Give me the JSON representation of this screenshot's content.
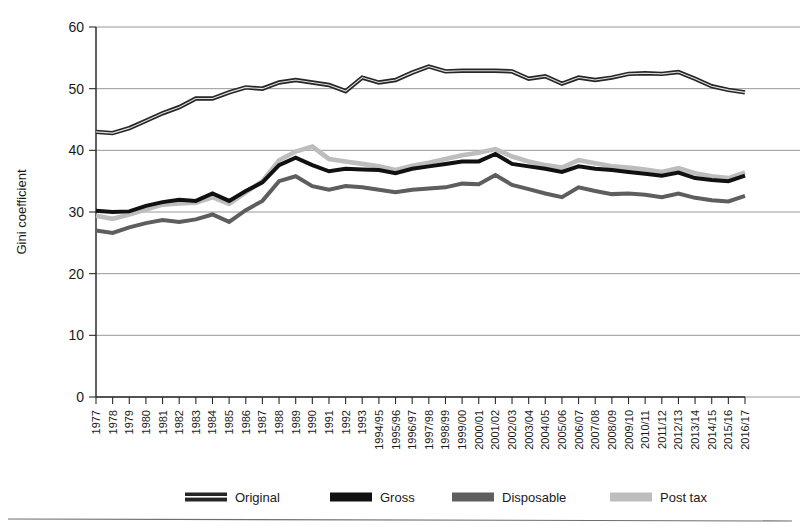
{
  "chart_data": {
    "type": "line",
    "title": "",
    "xlabel": "",
    "ylabel": "Gini coefficient",
    "ylim": [
      0,
      60
    ],
    "ytick_labels": [
      "0",
      "10",
      "20",
      "30",
      "40",
      "50",
      "60"
    ],
    "ytick_values": [
      0,
      10,
      20,
      30,
      40,
      50,
      60
    ],
    "grid": true,
    "legend_position": "bottom",
    "categories": [
      "1977",
      "1978",
      "1979",
      "1980",
      "1981",
      "1982",
      "1983",
      "1984",
      "1985",
      "1986",
      "1987",
      "1988",
      "1989",
      "1990",
      "1991",
      "1992",
      "1993",
      "1994/95",
      "1995/96",
      "1996/97",
      "1997/98",
      "1998/99",
      "1999/00",
      "2000/01",
      "2001/02",
      "2002/03",
      "2003/04",
      "2004/05",
      "2005/06",
      "2006/07",
      "2007/08",
      "2008/09",
      "2009/10",
      "2010/11",
      "2011/12",
      "2012/13",
      "2013/14",
      "2014/15",
      "2015/16",
      "2016/17"
    ],
    "series": [
      {
        "name": "Original",
        "color": "#262626",
        "style": "dark-outline",
        "values": [
          43.0,
          42.8,
          43.6,
          44.8,
          46.0,
          47.0,
          48.4,
          48.4,
          49.4,
          50.2,
          50.0,
          51.0,
          51.4,
          51.0,
          50.6,
          49.6,
          51.8,
          51.0,
          51.4,
          52.6,
          53.6,
          52.8,
          52.9,
          52.9,
          52.9,
          52.8,
          51.6,
          52.0,
          50.8,
          51.8,
          51.4,
          51.8,
          52.4,
          52.5,
          52.4,
          52.7,
          51.6,
          50.4,
          49.8,
          49.4
        ]
      },
      {
        "name": "Gross",
        "color": "#111111",
        "style": "solid-black",
        "values": [
          30.2,
          30.0,
          30.1,
          31.0,
          31.6,
          32.0,
          31.8,
          33.0,
          31.8,
          33.4,
          34.8,
          37.6,
          38.8,
          37.6,
          36.6,
          37.0,
          36.9,
          36.8,
          36.3,
          37.0,
          37.4,
          37.8,
          38.2,
          38.2,
          39.4,
          37.8,
          37.4,
          37.0,
          36.5,
          37.4,
          37.0,
          36.8,
          36.5,
          36.2,
          35.9,
          36.4,
          35.5,
          35.2,
          35.0,
          35.9
        ]
      },
      {
        "name": "Disposable",
        "color": "#5e5e5e",
        "style": "mid-gray",
        "values": [
          27.0,
          26.6,
          27.5,
          28.2,
          28.7,
          28.4,
          28.8,
          29.6,
          28.4,
          30.3,
          31.8,
          35.0,
          35.8,
          34.2,
          33.6,
          34.2,
          34.0,
          33.6,
          33.2,
          33.6,
          33.8,
          34.0,
          34.6,
          34.5,
          36.0,
          34.4,
          33.7,
          33.0,
          32.4,
          34.0,
          33.4,
          32.9,
          33.0,
          32.8,
          32.4,
          33.0,
          32.3,
          31.9,
          31.7,
          32.6
        ]
      },
      {
        "name": "Post tax",
        "color": "#bdbdbd",
        "style": "light-gray",
        "values": [
          29.4,
          28.9,
          29.6,
          30.4,
          31.2,
          31.4,
          31.5,
          32.4,
          31.3,
          33.2,
          35.0,
          38.4,
          39.8,
          40.6,
          38.6,
          38.2,
          37.8,
          37.4,
          36.8,
          37.5,
          38.0,
          38.6,
          39.2,
          39.6,
          40.2,
          39.0,
          38.2,
          37.6,
          37.2,
          38.4,
          37.9,
          37.4,
          37.2,
          36.9,
          36.5,
          37.1,
          36.3,
          35.8,
          35.5,
          36.4
        ]
      }
    ],
    "legend": [
      {
        "label": "Original",
        "color": "#262626"
      },
      {
        "label": "Gross",
        "color": "#111111"
      },
      {
        "label": "Disposable",
        "color": "#5e5e5e"
      },
      {
        "label": "Post tax",
        "color": "#bdbdbd"
      }
    ]
  }
}
